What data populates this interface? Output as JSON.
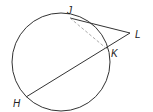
{
  "diagram": {
    "type": "circle-geometry",
    "colors": {
      "stroke": "#333333",
      "dashed": "#aaaaaa",
      "label": "#222222",
      "background": "#ffffff"
    },
    "circle": {
      "cx": 61,
      "cy": 62,
      "r": 49
    },
    "points": {
      "J": {
        "label": "J",
        "x": 70,
        "y": 18
      },
      "K": {
        "label": "K",
        "x": 107,
        "y": 49
      },
      "L": {
        "label": "L",
        "x": 130,
        "y": 33
      },
      "H": {
        "label": "H",
        "x": 26,
        "y": 97
      }
    },
    "segments": [
      {
        "name": "JL",
        "from": "J",
        "to": "L",
        "style": "solid",
        "role": "tangent"
      },
      {
        "name": "LH",
        "from": "L",
        "to": "H",
        "style": "solid",
        "role": "secant"
      },
      {
        "name": "JK",
        "from": "J",
        "to": "K",
        "style": "dashed",
        "role": "chord"
      }
    ]
  }
}
